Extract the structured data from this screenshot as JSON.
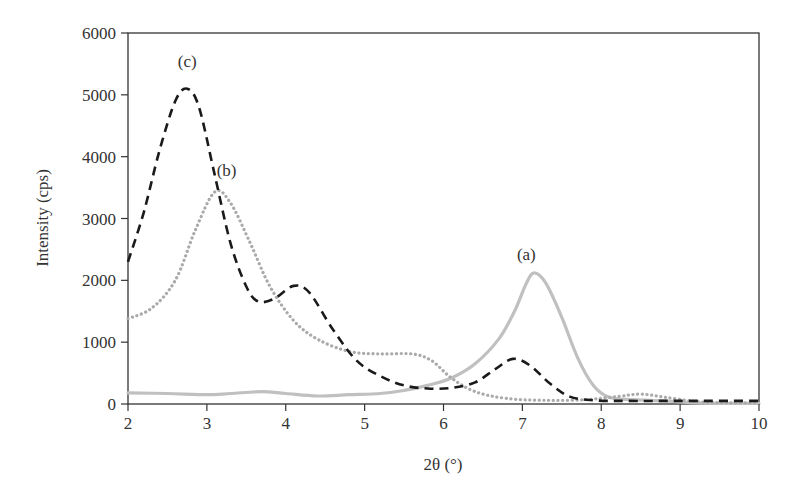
{
  "chart_data": {
    "type": "line",
    "title": "",
    "xlabel": "2θ (°)",
    "ylabel": "Intensity (cps)",
    "xlim": [
      2,
      10
    ],
    "ylim": [
      0,
      6000
    ],
    "x_ticks": [
      2,
      3,
      4,
      5,
      6,
      7,
      8,
      9,
      10
    ],
    "y_ticks": [
      0,
      1000,
      2000,
      3000,
      4000,
      5000,
      6000
    ],
    "grid": false,
    "legend": "none (inline labels)",
    "annotations": [
      {
        "text": "(c)",
        "x": 2.75,
        "y": 5450
      },
      {
        "text": "(b)",
        "x": 3.25,
        "y": 3680
      },
      {
        "text": "(a)",
        "x": 7.05,
        "y": 2330
      }
    ],
    "series": [
      {
        "name": "(a)",
        "style": "solid",
        "color": "#c0c0c0",
        "points": [
          [
            2.0,
            180
          ],
          [
            2.5,
            170
          ],
          [
            3.0,
            150
          ],
          [
            3.3,
            170
          ],
          [
            3.7,
            200
          ],
          [
            4.0,
            170
          ],
          [
            4.4,
            130
          ],
          [
            4.8,
            150
          ],
          [
            5.2,
            170
          ],
          [
            5.5,
            220
          ],
          [
            5.8,
            300
          ],
          [
            6.1,
            420
          ],
          [
            6.4,
            650
          ],
          [
            6.7,
            1050
          ],
          [
            6.9,
            1500
          ],
          [
            7.05,
            1950
          ],
          [
            7.15,
            2120
          ],
          [
            7.3,
            1950
          ],
          [
            7.5,
            1400
          ],
          [
            7.7,
            750
          ],
          [
            7.9,
            300
          ],
          [
            8.1,
            110
          ],
          [
            8.4,
            70
          ],
          [
            8.8,
            50
          ],
          [
            9.2,
            20
          ],
          [
            9.6,
            10
          ],
          [
            10.0,
            10
          ]
        ]
      },
      {
        "name": "(b)",
        "style": "dotted",
        "color": "#aaaaaa",
        "points": [
          [
            2.0,
            1380
          ],
          [
            2.3,
            1550
          ],
          [
            2.6,
            2000
          ],
          [
            2.85,
            2800
          ],
          [
            3.1,
            3430
          ],
          [
            3.3,
            3250
          ],
          [
            3.55,
            2600
          ],
          [
            3.8,
            1900
          ],
          [
            4.1,
            1350
          ],
          [
            4.4,
            1050
          ],
          [
            4.8,
            850
          ],
          [
            5.2,
            810
          ],
          [
            5.6,
            810
          ],
          [
            5.85,
            700
          ],
          [
            6.1,
            420
          ],
          [
            6.4,
            200
          ],
          [
            6.8,
            90
          ],
          [
            7.3,
            60
          ],
          [
            7.8,
            70
          ],
          [
            8.2,
            120
          ],
          [
            8.5,
            160
          ],
          [
            8.8,
            110
          ],
          [
            9.2,
            40
          ],
          [
            9.6,
            20
          ],
          [
            10.0,
            20
          ]
        ]
      },
      {
        "name": "(c)",
        "style": "dashed",
        "color": "#1a1a1a",
        "points": [
          [
            2.0,
            2300
          ],
          [
            2.2,
            3100
          ],
          [
            2.4,
            4100
          ],
          [
            2.6,
            4900
          ],
          [
            2.75,
            5100
          ],
          [
            2.9,
            4800
          ],
          [
            3.1,
            3700
          ],
          [
            3.3,
            2600
          ],
          [
            3.5,
            1900
          ],
          [
            3.65,
            1660
          ],
          [
            3.85,
            1700
          ],
          [
            4.1,
            1910
          ],
          [
            4.3,
            1800
          ],
          [
            4.6,
            1200
          ],
          [
            4.9,
            700
          ],
          [
            5.2,
            450
          ],
          [
            5.5,
            300
          ],
          [
            5.8,
            250
          ],
          [
            6.1,
            260
          ],
          [
            6.4,
            350
          ],
          [
            6.65,
            560
          ],
          [
            6.88,
            730
          ],
          [
            7.1,
            620
          ],
          [
            7.35,
            330
          ],
          [
            7.6,
            120
          ],
          [
            7.9,
            60
          ],
          [
            8.3,
            50
          ],
          [
            9.0,
            50
          ],
          [
            10.0,
            50
          ]
        ]
      }
    ]
  },
  "axes": {
    "xlabel": "2θ (°)",
    "ylabel": "Intensity (cps)",
    "x_tick_labels": [
      "2",
      "3",
      "4",
      "5",
      "6",
      "7",
      "8",
      "9",
      "10"
    ],
    "y_tick_labels": [
      "0",
      "1000",
      "2000",
      "3000",
      "4000",
      "5000",
      "6000"
    ]
  }
}
